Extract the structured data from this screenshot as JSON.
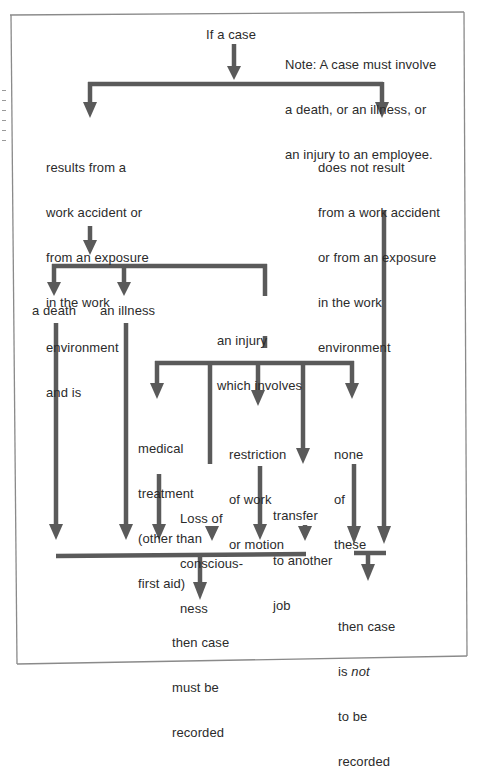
{
  "diagram": {
    "colors": {
      "arrow": "#5a5a5a",
      "frame": "#8a8a8a",
      "text": "#2b2b2b"
    },
    "start": {
      "label": "If a case"
    },
    "note": {
      "lines": [
        "Note: A case must involve",
        "a death, or an illness, or",
        "an injury to an employee."
      ]
    },
    "branch_work": {
      "lines": [
        "results from a",
        "work accident or",
        "from an exposure",
        "in the work",
        "environment",
        "and is"
      ]
    },
    "branch_not_work": {
      "lines": [
        "does not result",
        "from a work accident",
        "or from an exposure",
        "in the work",
        "environment"
      ]
    },
    "outcomes_level1": {
      "death": "a death",
      "illness": "an illness",
      "injury": {
        "lines": [
          "an injury",
          "which involves"
        ]
      }
    },
    "injury_types": {
      "medical": {
        "lines": [
          "medical",
          "treatment",
          "(other than",
          "first aid)"
        ]
      },
      "consciousness": {
        "lines": [
          "Loss of",
          "conscious-",
          "ness"
        ]
      },
      "restriction": {
        "lines": [
          "restriction",
          "of work",
          "or motion"
        ]
      },
      "transfer": {
        "lines": [
          "transfer",
          "to another",
          "job"
        ]
      },
      "none": {
        "lines": [
          "none",
          "of",
          "these"
        ]
      }
    },
    "result_recorded": {
      "lines": [
        "then case",
        "must be",
        "recorded"
      ]
    },
    "result_not_recorded": {
      "line1": "then case",
      "line2_prefix": "is ",
      "line2_emph": "not",
      "line3": "to be",
      "line4": "recorded"
    }
  }
}
